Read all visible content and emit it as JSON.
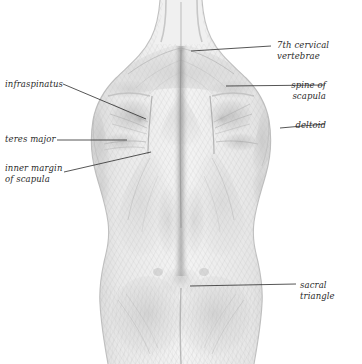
{
  "figure": {
    "width": 362,
    "height": 364,
    "background_color": "#ffffff",
    "ink_color": "#2b2b2b",
    "shading_color": "#a9a9a9",
    "medium": "pencil drawing"
  },
  "labels": [
    {
      "id": "seventh-cervical-vertebrae",
      "text": "7th cervical vertebrae",
      "align": "left",
      "x": 277,
      "y": 40,
      "leader": {
        "x1": 191,
        "y1": 51,
        "x2": 271,
        "y2": 46
      }
    },
    {
      "id": "spine-of-scapula",
      "text": "spine of\nscapula",
      "align": "right",
      "x": 296,
      "y": 80,
      "leader": {
        "x1": 226,
        "y1": 86,
        "x2": 325,
        "y2": 85
      }
    },
    {
      "id": "deltoid",
      "text": "deltoid",
      "align": "right",
      "x": 296,
      "y": 120,
      "leader": {
        "x1": 280,
        "y1": 128,
        "x2": 325,
        "y2": 124
      }
    },
    {
      "id": "sacral-triangle",
      "text": "sacral triangle",
      "align": "left",
      "x": 300,
      "y": 280,
      "leader": {
        "x1": 190,
        "y1": 286,
        "x2": 296,
        "y2": 284
      }
    },
    {
      "id": "infraspinatus",
      "text": "infraspinatus",
      "align": "left",
      "x": 5,
      "y": 79,
      "leader": {
        "x1": 63,
        "y1": 84,
        "x2": 146,
        "y2": 119
      }
    },
    {
      "id": "teres-major",
      "text": "teres major",
      "align": "left",
      "x": 5,
      "y": 134,
      "leader": {
        "x1": 57,
        "y1": 140,
        "x2": 127,
        "y2": 140
      }
    },
    {
      "id": "inner-margin-of-scapula",
      "text": "inner margin\nof scapula",
      "align": "left",
      "x": 5,
      "y": 163,
      "leader": {
        "x1": 64,
        "y1": 172,
        "x2": 151,
        "y2": 152
      }
    }
  ]
}
